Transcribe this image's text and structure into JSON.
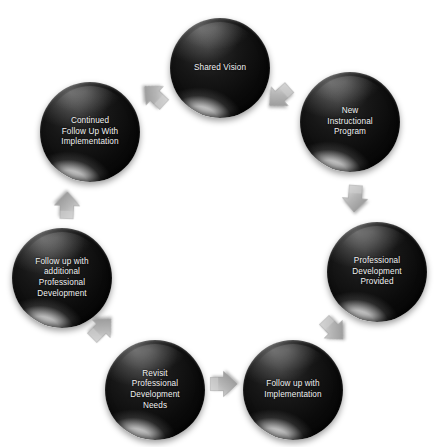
{
  "diagram": {
    "type": "cyclical-process",
    "background_color": "#ffffff",
    "node_color": "#111111",
    "node_text_color": "#f2f2f2",
    "arrow_color": "#a8a8a8",
    "node_count": 7,
    "arrow_count": 7,
    "nodes": [
      {
        "id": "shared-vision",
        "label": "Shared Vision"
      },
      {
        "id": "new-instructional-program",
        "label": "New\nInstructional\nProgram"
      },
      {
        "id": "professional-development-provided",
        "label": "Professional\nDevelopment\nProvided"
      },
      {
        "id": "follow-up-with-implementation",
        "label": "Follow up with\nImplementation"
      },
      {
        "id": "revisit-professional-development-needs",
        "label": "Revisit\nProfessional\nDevelopment\nNeeds"
      },
      {
        "id": "follow-up-with-additional-professional-development",
        "label": "Follow up with\nadditional\nProfessional\nDevelopment"
      },
      {
        "id": "continued-follow-up-with-implementation",
        "label": "Continued\nFollow Up With\nImplementation"
      }
    ],
    "arrows": [
      {
        "id": "arrow-1",
        "from": "shared-vision",
        "to": "new-instructional-program",
        "direction": "down-right"
      },
      {
        "id": "arrow-2",
        "from": "new-instructional-program",
        "to": "professional-development-provided",
        "direction": "down"
      },
      {
        "id": "arrow-3",
        "from": "professional-development-provided",
        "to": "follow-up-with-implementation",
        "direction": "down-left"
      },
      {
        "id": "arrow-4",
        "from": "follow-up-with-implementation",
        "to": "revisit-professional-development-needs",
        "direction": "left"
      },
      {
        "id": "arrow-5",
        "from": "revisit-professional-development-needs",
        "to": "follow-up-with-additional-professional-development",
        "direction": "up-left"
      },
      {
        "id": "arrow-6",
        "from": "follow-up-with-additional-professional-development",
        "to": "continued-follow-up-with-implementation",
        "direction": "up"
      },
      {
        "id": "arrow-7",
        "from": "continued-follow-up-with-implementation",
        "to": "shared-vision",
        "direction": "up-right"
      }
    ]
  }
}
